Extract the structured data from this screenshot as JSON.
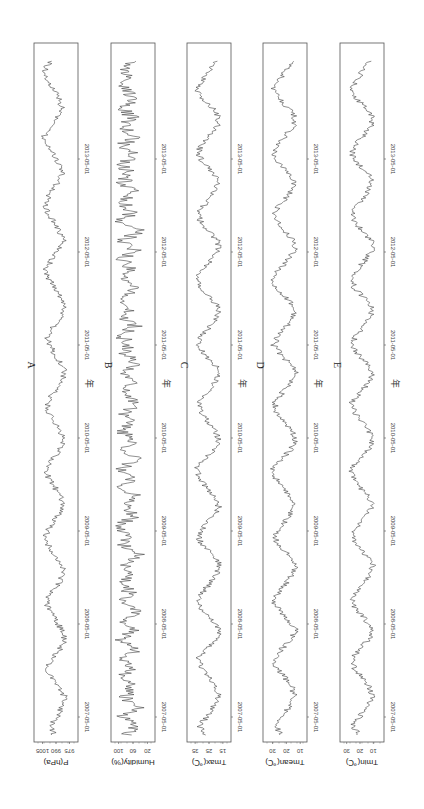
{
  "chart_data": [
    {
      "type": "line",
      "panel": "A",
      "title": "A",
      "xlabel": "年",
      "ylabel": "P(hPa)",
      "x_ticks": [
        "2007-05-01",
        "2008-05-01",
        "2009-05-01",
        "2010-05-01",
        "2011-05-01",
        "2012-05-01",
        "2013-05-01"
      ],
      "y_ticks": [
        975,
        990,
        1005
      ],
      "ylim": [
        970,
        1010
      ],
      "x_range": [
        "2007-01",
        "2013-12"
      ],
      "series": [
        {
          "name": "Pressure",
          "values": [
            992,
            996,
            988,
            984,
            980,
            986,
            995,
            1000,
            994,
            986,
            980,
            983,
            990,
            997,
            1001,
            995,
            987,
            981,
            984,
            992,
            999,
            1002,
            996,
            988,
            982,
            985,
            991,
            998,
            1001,
            994,
            986,
            981,
            986,
            993,
            999,
            1000,
            993,
            986,
            980,
            984,
            991,
            997,
            1000,
            993,
            985,
            980,
            985,
            992,
            998,
            1001,
            995,
            988,
            982,
            986,
            993,
            999,
            1002,
            996,
            989,
            983,
            986,
            992,
            999,
            1003,
            997,
            990,
            984,
            987,
            994,
            1000,
            1002,
            996
          ]
        }
      ]
    },
    {
      "type": "line",
      "panel": "B",
      "title": "B",
      "xlabel": "年",
      "ylabel": "Humidity(%)",
      "x_ticks": [
        "2007-05-01",
        "2008-05-01",
        "2009-05-01",
        "2010-05-01",
        "2011-05-01",
        "2012-05-01",
        "2013-05-01"
      ],
      "y_ticks": [
        20,
        60,
        100
      ],
      "ylim": [
        10,
        110
      ],
      "series": [
        {
          "name": "Humidity",
          "values": [
            80,
            55,
            90,
            45,
            85,
            60,
            95,
            70,
            88,
            50,
            92,
            65,
            85,
            40,
            90,
            70,
            95,
            60,
            82,
            48,
            88,
            72,
            96,
            58,
            84,
            45,
            90,
            66,
            94,
            52,
            86,
            62,
            92,
            74,
            80,
            50,
            88,
            60,
            94,
            46,
            84,
            70,
            92,
            56,
            86,
            64,
            95,
            52,
            82,
            68,
            90,
            58,
            88,
            44,
            92,
            66,
            84,
            54,
            90,
            70,
            86,
            60,
            94,
            50,
            88,
            64,
            92,
            56,
            84,
            72,
            90,
            62
          ]
        }
      ]
    },
    {
      "type": "line",
      "panel": "C",
      "title": "C",
      "xlabel": "年",
      "ylabel": "Tmax(℃)",
      "x_ticks": [
        "2007-05-01",
        "2008-05-01",
        "2009-05-01",
        "2010-05-01",
        "2011-05-01",
        "2012-05-01",
        "2013-05-01"
      ],
      "y_ticks": [
        15,
        25,
        35
      ],
      "ylim": [
        12,
        38
      ],
      "series": [
        {
          "name": "Tmax",
          "values": [
            28,
            32,
            26,
            22,
            18,
            20,
            24,
            30,
            33,
            27,
            21,
            17,
            22,
            29,
            34,
            30,
            24,
            19,
            17,
            23,
            30,
            33,
            28,
            22,
            18,
            20,
            27,
            32,
            34,
            28,
            21,
            18,
            20,
            26,
            31,
            33,
            27,
            21,
            17,
            21,
            28,
            33,
            30,
            24,
            19,
            18,
            24,
            31,
            34,
            29,
            23,
            18,
            19,
            25,
            31,
            33,
            27,
            22,
            18,
            21,
            28,
            33,
            31,
            25,
            19,
            18,
            23,
            30,
            34,
            29,
            24,
            20
          ]
        }
      ]
    },
    {
      "type": "line",
      "panel": "D",
      "title": "D",
      "xlabel": "年",
      "ylabel": "Tmean(℃)",
      "x_ticks": [
        "2007-05-01",
        "2008-05-01",
        "2009-05-01",
        "2010-05-01",
        "2011-05-01",
        "2012-05-01",
        "2013-05-01"
      ],
      "y_ticks": [
        10,
        20,
        30
      ],
      "ylim": [
        8,
        34
      ],
      "series": [
        {
          "name": "Tmean",
          "values": [
            24,
            28,
            23,
            18,
            14,
            16,
            21,
            27,
            29,
            24,
            17,
            13,
            18,
            25,
            29,
            26,
            20,
            15,
            13,
            19,
            26,
            29,
            24,
            18,
            14,
            16,
            23,
            28,
            30,
            24,
            17,
            14,
            16,
            22,
            27,
            29,
            23,
            17,
            13,
            17,
            24,
            29,
            26,
            20,
            15,
            14,
            20,
            27,
            30,
            25,
            19,
            14,
            15,
            21,
            27,
            29,
            23,
            18,
            14,
            17,
            24,
            29,
            27,
            21,
            15,
            14,
            19,
            26,
            30,
            25,
            20,
            16
          ]
        }
      ]
    },
    {
      "type": "line",
      "panel": "E",
      "title": "E",
      "xlabel": "年",
      "ylabel": "Tmin(℃)",
      "x_ticks": [
        "2007-05-01",
        "2008-05-01",
        "2009-05-01",
        "2010-05-01",
        "2011-05-01",
        "2012-05-01",
        "2013-05-01"
      ],
      "y_ticks": [
        10,
        20,
        30
      ],
      "ylim": [
        5,
        32
      ],
      "series": [
        {
          "name": "Tmin",
          "values": [
            21,
            25,
            20,
            15,
            11,
            13,
            18,
            24,
            26,
            21,
            14,
            10,
            15,
            22,
            26,
            23,
            17,
            12,
            10,
            16,
            23,
            26,
            21,
            15,
            11,
            13,
            20,
            25,
            27,
            21,
            14,
            11,
            13,
            19,
            24,
            26,
            20,
            14,
            10,
            14,
            21,
            26,
            23,
            17,
            12,
            11,
            17,
            24,
            27,
            22,
            16,
            11,
            12,
            18,
            24,
            26,
            20,
            15,
            11,
            14,
            21,
            26,
            24,
            18,
            12,
            11,
            16,
            23,
            27,
            22,
            17,
            13
          ]
        }
      ]
    }
  ],
  "figure": {
    "orientation": "rotated-90",
    "year_label": "年"
  }
}
